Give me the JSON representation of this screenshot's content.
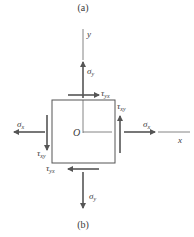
{
  "diagram": {
    "caption_top": "(a)",
    "caption_bottom": "(b)",
    "axes": {
      "y_label": "y",
      "x_label": "x",
      "origin_label": "O"
    },
    "stresses": {
      "sigma_y_top": {
        "symbol": "σ",
        "sub": "y"
      },
      "sigma_y_bottom": {
        "symbol": "σ",
        "sub": "y"
      },
      "sigma_x_right": {
        "symbol": "σ",
        "sub": "x"
      },
      "sigma_x_left": {
        "symbol": "σ",
        "sub": "x"
      },
      "tau_yx_top": {
        "symbol": "τ",
        "sub": "yx"
      },
      "tau_yx_bottom": {
        "symbol": "τ",
        "sub": "yx"
      },
      "tau_xy_right": {
        "symbol": "τ",
        "sub": "xy"
      },
      "tau_xy_left": {
        "symbol": "τ",
        "sub": "xy"
      }
    },
    "colors": {
      "line": "#555555",
      "text": "#3a3a3a"
    }
  }
}
